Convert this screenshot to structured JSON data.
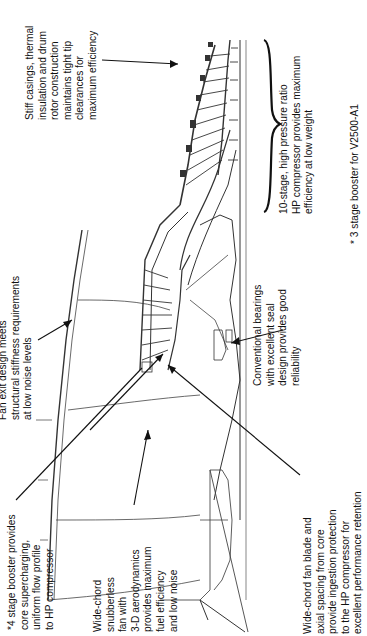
{
  "diagram": {
    "callouts": [
      {
        "id": "booster",
        "lines": [
          "*4 stage booster provides",
          "core supercharging,",
          "uniform flow profile",
          "to HP compressor"
        ]
      },
      {
        "id": "wide-chord-fan",
        "lines": [
          "Wide-chord",
          "snubberless",
          "fan with",
          "3-D aerodynamics",
          "provides maximum",
          "fuel efficiency",
          "and low noise"
        ]
      },
      {
        "id": "fan-exit",
        "lines": [
          "Fan exit design meets",
          "structural stiffness requirements",
          "at low noise levels"
        ]
      },
      {
        "id": "bearings",
        "lines": [
          "Conventional bearings",
          "with excellent seal",
          "design provides good",
          "reliability"
        ]
      },
      {
        "id": "fan-blade-spacing",
        "lines": [
          "Wide-chord fan blade and",
          "axial spacing from core",
          "provide ingestion protection",
          "to the HP compressor for",
          "excellent performance retention"
        ]
      },
      {
        "id": "stiff-casings",
        "lines": [
          "Stiff casings, thermal",
          "insulation and drum",
          "rotor construction",
          "maintains tight tip",
          "clearances for",
          "maximum efficiency"
        ]
      },
      {
        "id": "hp-compressor",
        "lines": [
          "10-stage, high pressure ratio",
          "HP compressor provides maximum",
          "efficiency at low weight"
        ]
      }
    ],
    "footnote": "* 3 stage booster for V2500-A1",
    "colors": {
      "line": "#222222",
      "background": "#ffffff",
      "text": "#111111"
    }
  }
}
